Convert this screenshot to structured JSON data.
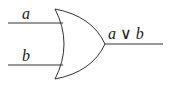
{
  "diagram": {
    "type": "logic-gate",
    "gate": "OR",
    "inputs": [
      {
        "label": "a"
      },
      {
        "label": "b"
      }
    ],
    "output": {
      "label": "a ∨ b"
    },
    "stroke_color": "#333333"
  }
}
